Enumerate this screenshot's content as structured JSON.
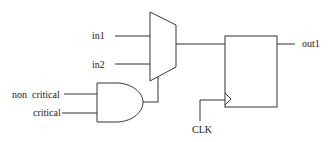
{
  "diagram": {
    "type": "logic-circuit",
    "colors": {
      "stroke": "#333333",
      "text": "#222222",
      "background": "#ffffff"
    },
    "inputs": {
      "in1": "in1",
      "in2": "in2",
      "non_critical": "non  critical",
      "critical": "critical",
      "clk": "CLK"
    },
    "outputs": {
      "out1": "out1"
    },
    "components": [
      {
        "id": "mux",
        "kind": "multiplexer",
        "inputs": [
          "in1",
          "in2"
        ],
        "select": "and_gate.out"
      },
      {
        "id": "and_gate",
        "kind": "AND",
        "inputs": [
          "non critical",
          "critical"
        ]
      },
      {
        "id": "flip_flop",
        "kind": "D flip-flop",
        "data": "mux.out",
        "clock": "CLK",
        "output": "out1"
      }
    ]
  }
}
